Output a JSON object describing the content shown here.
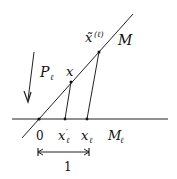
{
  "diagram": {
    "labels": {
      "M": "M",
      "x_tilde": "x̃",
      "x_tilde_sup": "(ℓ)",
      "P": "P",
      "P_sub": "ℓ",
      "x": "x",
      "zero": "0",
      "x_prime": "x",
      "x_prime_sup": "′",
      "x_prime_sub": "ℓ",
      "x_l": "x",
      "x_l_sub": "ℓ",
      "M_l": "M",
      "M_l_sub": "ℓ",
      "unit": "1"
    }
  }
}
